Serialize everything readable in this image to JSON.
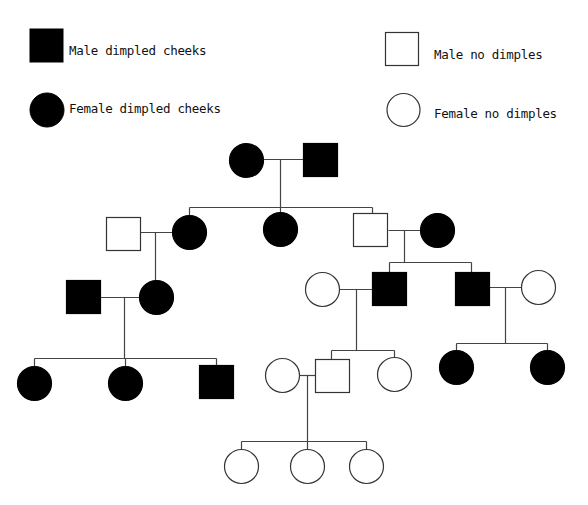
{
  "header": {
    "cropped_caption_fragment": ""
  },
  "legend": {
    "items": [
      {
        "key": "male_affected",
        "label": "Male dimpled cheeks",
        "shape": "square",
        "filled": true
      },
      {
        "key": "female_affected",
        "label": "Female dimpled cheeks",
        "shape": "circle",
        "filled": true
      },
      {
        "key": "male_unaffected",
        "label": "Male no dimples",
        "shape": "square",
        "filled": false
      },
      {
        "key": "female_unaffected",
        "label": "Female no dimples",
        "shape": "circle",
        "filled": false
      }
    ]
  },
  "colors": {
    "affected_fill": "#000000",
    "unaffected_fill": "#ffffff",
    "stroke": "#333333",
    "line": "#444444",
    "text": "#111111",
    "background": "#ffffff"
  },
  "pedigree": {
    "title": "Dimpled cheeks pedigree",
    "generations": 5,
    "individuals": [
      {
        "id": "I-1",
        "generation": 1,
        "sex": "female",
        "affected": true,
        "cx": 246,
        "cy": 160
      },
      {
        "id": "I-2",
        "generation": 1,
        "sex": "male",
        "affected": true,
        "cx": 320,
        "cy": 160
      },
      {
        "id": "II-1",
        "generation": 2,
        "sex": "male",
        "affected": false,
        "cx": 123,
        "cy": 234,
        "spouse_in": true
      },
      {
        "id": "II-2",
        "generation": 2,
        "sex": "female",
        "affected": true,
        "cx": 189,
        "cy": 232
      },
      {
        "id": "II-3",
        "generation": 2,
        "sex": "female",
        "affected": true,
        "cx": 280,
        "cy": 229
      },
      {
        "id": "II-4",
        "generation": 2,
        "sex": "male",
        "affected": false,
        "cx": 370,
        "cy": 230
      },
      {
        "id": "II-5",
        "generation": 2,
        "sex": "female",
        "affected": true,
        "cx": 437,
        "cy": 230,
        "spouse_in": true
      },
      {
        "id": "III-1",
        "generation": 3,
        "sex": "male",
        "affected": true,
        "cx": 83,
        "cy": 297,
        "spouse_in": true
      },
      {
        "id": "III-2",
        "generation": 3,
        "sex": "female",
        "affected": true,
        "cx": 156,
        "cy": 297
      },
      {
        "id": "III-3",
        "generation": 3,
        "sex": "female",
        "affected": false,
        "cx": 322,
        "cy": 289,
        "spouse_in": true
      },
      {
        "id": "III-4",
        "generation": 3,
        "sex": "male",
        "affected": true,
        "cx": 389,
        "cy": 289
      },
      {
        "id": "III-5",
        "generation": 3,
        "sex": "male",
        "affected": true,
        "cx": 472,
        "cy": 289
      },
      {
        "id": "III-6",
        "generation": 3,
        "sex": "female",
        "affected": false,
        "cx": 538,
        "cy": 287,
        "spouse_in": true
      },
      {
        "id": "IV-1",
        "generation": 4,
        "sex": "female",
        "affected": true,
        "cx": 34,
        "cy": 383
      },
      {
        "id": "IV-2",
        "generation": 4,
        "sex": "female",
        "affected": true,
        "cx": 125,
        "cy": 383
      },
      {
        "id": "IV-3",
        "generation": 4,
        "sex": "male",
        "affected": true,
        "cx": 216,
        "cy": 382
      },
      {
        "id": "IV-4",
        "generation": 4,
        "sex": "female",
        "affected": false,
        "cx": 282,
        "cy": 375,
        "spouse_in": true
      },
      {
        "id": "IV-5",
        "generation": 4,
        "sex": "male",
        "affected": false,
        "cx": 332,
        "cy": 376
      },
      {
        "id": "IV-6",
        "generation": 4,
        "sex": "female",
        "affected": false,
        "cx": 394,
        "cy": 374
      },
      {
        "id": "IV-7",
        "generation": 4,
        "sex": "female",
        "affected": true,
        "cx": 456,
        "cy": 367
      },
      {
        "id": "IV-8",
        "generation": 4,
        "sex": "female",
        "affected": true,
        "cx": 547,
        "cy": 367
      },
      {
        "id": "V-1",
        "generation": 5,
        "sex": "female",
        "affected": false,
        "cx": 241,
        "cy": 466
      },
      {
        "id": "V-2",
        "generation": 5,
        "sex": "female",
        "affected": false,
        "cx": 307,
        "cy": 466
      },
      {
        "id": "V-3",
        "generation": 5,
        "sex": "female",
        "affected": false,
        "cx": 366,
        "cy": 466
      }
    ],
    "lines": [
      {
        "id": "mate-I",
        "x1": 263,
        "y1": 159,
        "x2": 303,
        "y2": 159
      },
      {
        "id": "desc-I",
        "x1": 280,
        "y1": 159,
        "x2": 280,
        "y2": 207
      },
      {
        "id": "sib-II",
        "x1": 189,
        "y1": 207,
        "x2": 372,
        "y2": 207
      },
      {
        "id": "drop-II-2",
        "x1": 189,
        "y1": 207,
        "x2": 189,
        "y2": 215
      },
      {
        "id": "drop-II-3",
        "x1": 280,
        "y1": 207,
        "x2": 280,
        "y2": 212
      },
      {
        "id": "drop-II-4",
        "x1": 372,
        "y1": 207,
        "x2": 372,
        "y2": 213
      },
      {
        "id": "mate-II-left",
        "x1": 140,
        "y1": 232,
        "x2": 172,
        "y2": 232
      },
      {
        "id": "desc-II-left",
        "x1": 155,
        "y1": 232,
        "x2": 155,
        "y2": 280
      },
      {
        "id": "mate-II-right",
        "x1": 388,
        "y1": 230,
        "x2": 420,
        "y2": 230
      },
      {
        "id": "desc-II-right",
        "x1": 404,
        "y1": 230,
        "x2": 404,
        "y2": 262
      },
      {
        "id": "sib-III-right",
        "x1": 389,
        "y1": 262,
        "x2": 471,
        "y2": 262
      },
      {
        "id": "drop-III-4",
        "x1": 389,
        "y1": 262,
        "x2": 389,
        "y2": 273
      },
      {
        "id": "drop-III-5",
        "x1": 471,
        "y1": 262,
        "x2": 471,
        "y2": 273
      },
      {
        "id": "mate-III-left",
        "x1": 100,
        "y1": 297,
        "x2": 139,
        "y2": 297
      },
      {
        "id": "desc-III-left",
        "x1": 124,
        "y1": 297,
        "x2": 124,
        "y2": 358
      },
      {
        "id": "sib-IV-left",
        "x1": 34,
        "y1": 358,
        "x2": 216,
        "y2": 358
      },
      {
        "id": "drop-IV-1",
        "x1": 34,
        "y1": 358,
        "x2": 34,
        "y2": 366
      },
      {
        "id": "drop-IV-2",
        "x1": 125,
        "y1": 358,
        "x2": 125,
        "y2": 366
      },
      {
        "id": "drop-IV-3",
        "x1": 216,
        "y1": 358,
        "x2": 216,
        "y2": 366
      },
      {
        "id": "mate-III-mid",
        "x1": 339,
        "y1": 289,
        "x2": 372,
        "y2": 289
      },
      {
        "id": "desc-III-mid",
        "x1": 356,
        "y1": 289,
        "x2": 356,
        "y2": 350
      },
      {
        "id": "sib-IV-mid",
        "x1": 331,
        "y1": 350,
        "x2": 394,
        "y2": 350
      },
      {
        "id": "drop-IV-5",
        "x1": 331,
        "y1": 350,
        "x2": 331,
        "y2": 361
      },
      {
        "id": "drop-IV-6",
        "x1": 394,
        "y1": 350,
        "x2": 394,
        "y2": 357
      },
      {
        "id": "mate-III-right",
        "x1": 489,
        "y1": 287,
        "x2": 521,
        "y2": 287
      },
      {
        "id": "desc-III-right",
        "x1": 505,
        "y1": 287,
        "x2": 505,
        "y2": 343
      },
      {
        "id": "sib-IV-right",
        "x1": 456,
        "y1": 343,
        "x2": 547,
        "y2": 343
      },
      {
        "id": "drop-IV-7",
        "x1": 456,
        "y1": 343,
        "x2": 456,
        "y2": 350
      },
      {
        "id": "drop-IV-8",
        "x1": 547,
        "y1": 343,
        "x2": 547,
        "y2": 350
      },
      {
        "id": "mate-IV",
        "x1": 299,
        "y1": 375,
        "x2": 315,
        "y2": 375
      },
      {
        "id": "desc-IV",
        "x1": 307,
        "y1": 375,
        "x2": 307,
        "y2": 441
      },
      {
        "id": "sib-V",
        "x1": 241,
        "y1": 441,
        "x2": 366,
        "y2": 441
      },
      {
        "id": "drop-V-1",
        "x1": 241,
        "y1": 441,
        "x2": 241,
        "y2": 449
      },
      {
        "id": "drop-V-2",
        "x1": 307,
        "y1": 441,
        "x2": 307,
        "y2": 449
      },
      {
        "id": "drop-V-3",
        "x1": 366,
        "y1": 441,
        "x2": 366,
        "y2": 449
      }
    ]
  }
}
